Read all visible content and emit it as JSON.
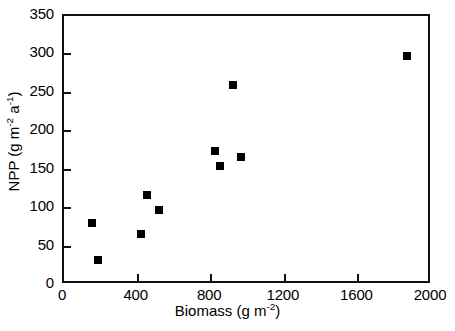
{
  "chart_data": {
    "type": "scatter",
    "title": "",
    "xlabel": "Biomass (g m-2)",
    "xlabel_parts": {
      "text": "Biomass (g m",
      "sup": "-2",
      "tail": ")"
    },
    "ylabel": "NPP (g m-2 a-1)",
    "ylabel_parts": {
      "lead": "NPP (g m",
      "sup1": "-2",
      "mid": " a",
      "sup2": "-1",
      "tail": ")"
    },
    "xlim": [
      0,
      2000
    ],
    "ylim": [
      0,
      350
    ],
    "xticks": [
      0,
      400,
      800,
      1200,
      1600,
      2000
    ],
    "yticks": [
      0,
      50,
      100,
      150,
      200,
      250,
      300,
      350
    ],
    "xtick_labels": [
      "0",
      "400",
      "800",
      "1200",
      "1600",
      "2000"
    ],
    "ytick_labels": [
      "0",
      "50",
      "100",
      "150",
      "200",
      "250",
      "300",
      "350"
    ],
    "grid": false,
    "legend": null,
    "marker": {
      "shape": "square",
      "color": "#000000",
      "size": 8
    },
    "points": [
      {
        "x": 152,
        "y": 81
      },
      {
        "x": 185,
        "y": 32
      },
      {
        "x": 418,
        "y": 67
      },
      {
        "x": 451,
        "y": 117
      },
      {
        "x": 516,
        "y": 98
      },
      {
        "x": 821,
        "y": 174
      },
      {
        "x": 848,
        "y": 155
      },
      {
        "x": 918,
        "y": 260
      },
      {
        "x": 962,
        "y": 167
      },
      {
        "x": 1864,
        "y": 298
      }
    ]
  }
}
